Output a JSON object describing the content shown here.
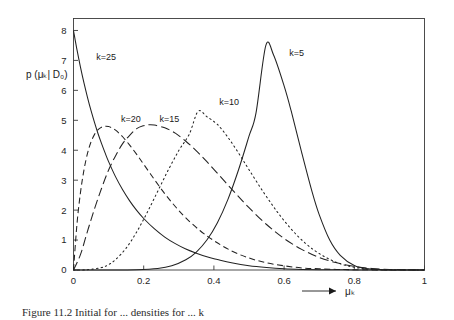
{
  "figure": {
    "caption": "Figure 11.2   Initial for ... densities for ... k"
  },
  "axes": {
    "ylabel": "p (μₖ| D₀)",
    "xlabel": "μₖ",
    "xlabel_arrow": "⟶",
    "x_ticks": [
      "0",
      "0.2",
      "0.4",
      "0.6",
      "0.8",
      "1"
    ],
    "x_tick_values": [
      0,
      0.2,
      0.4,
      0.6,
      0.8,
      1
    ],
    "y_ticks": [
      "0",
      "1",
      "2",
      "3",
      "4",
      "5",
      "6",
      "7",
      "8"
    ],
    "y_tick_values": [
      0,
      1,
      2,
      3,
      4,
      5,
      6,
      7,
      8
    ]
  },
  "chart_data": {
    "type": "line",
    "title": "",
    "xlabel": "μₖ",
    "ylabel": "p (μₖ| D₀)",
    "xlim": [
      0,
      1
    ],
    "ylim": [
      0,
      8.4
    ],
    "grid": false,
    "legend": "inline-annotations",
    "series": [
      {
        "name": "k=25",
        "label": "k=25",
        "style": "solid",
        "color": "#222222",
        "label_x": 0.065,
        "label_y": 7.0,
        "peak_x": 0.0,
        "peak_y": 8.0,
        "x": [
          0.0,
          0.01,
          0.02,
          0.03,
          0.04,
          0.05,
          0.06,
          0.07,
          0.08,
          0.09,
          0.1,
          0.12,
          0.14,
          0.16,
          0.18,
          0.2,
          0.23,
          0.26,
          0.29,
          0.32,
          0.35,
          0.38,
          0.41,
          0.45,
          0.5,
          0.55,
          0.6,
          0.65,
          0.7,
          0.75,
          0.8,
          0.85,
          0.9,
          0.95,
          1.0
        ],
        "y": [
          8.0,
          7.35,
          6.77,
          6.24,
          5.76,
          5.32,
          4.92,
          4.55,
          4.22,
          3.91,
          3.62,
          3.11,
          2.68,
          2.31,
          1.99,
          1.72,
          1.38,
          1.1,
          0.88,
          0.7,
          0.56,
          0.44,
          0.35,
          0.24,
          0.14,
          0.08,
          0.04,
          0.02,
          0.01,
          0.01,
          0.0,
          0.0,
          0.0,
          0.0,
          0.0
        ]
      },
      {
        "name": "k=20",
        "label": "k=20",
        "style": "dashed",
        "color": "#222222",
        "label_x": 0.135,
        "label_y": 4.95,
        "peak_x": 0.11,
        "peak_y": 4.8,
        "x": [
          0.0,
          0.01,
          0.02,
          0.03,
          0.04,
          0.05,
          0.06,
          0.07,
          0.08,
          0.09,
          0.1,
          0.11,
          0.12,
          0.14,
          0.16,
          0.18,
          0.2,
          0.23,
          0.26,
          0.29,
          0.32,
          0.36,
          0.4,
          0.45,
          0.5,
          0.55,
          0.6,
          0.65,
          0.7,
          0.75,
          0.8,
          0.9,
          1.0
        ],
        "y": [
          0.0,
          1.55,
          2.6,
          3.35,
          3.9,
          4.28,
          4.53,
          4.69,
          4.77,
          4.8,
          4.79,
          4.74,
          4.67,
          4.45,
          4.17,
          3.86,
          3.53,
          3.03,
          2.55,
          2.12,
          1.74,
          1.32,
          0.98,
          0.64,
          0.4,
          0.24,
          0.14,
          0.07,
          0.04,
          0.02,
          0.01,
          0.0,
          0.0
        ]
      },
      {
        "name": "k=15",
        "label": "k=15",
        "style": "longdash",
        "color": "#222222",
        "label_x": 0.245,
        "label_y": 4.95,
        "peak_x": 0.215,
        "peak_y": 4.85,
        "x": [
          0.0,
          0.02,
          0.04,
          0.06,
          0.08,
          0.1,
          0.12,
          0.14,
          0.16,
          0.18,
          0.2,
          0.215,
          0.23,
          0.26,
          0.29,
          0.32,
          0.35,
          0.38,
          0.42,
          0.46,
          0.5,
          0.55,
          0.6,
          0.65,
          0.7,
          0.75,
          0.8,
          0.85,
          0.9,
          1.0
        ],
        "y": [
          0.0,
          0.52,
          1.3,
          2.05,
          2.73,
          3.34,
          3.82,
          4.22,
          4.5,
          4.72,
          4.82,
          4.85,
          4.84,
          4.75,
          4.57,
          4.3,
          3.98,
          3.62,
          3.1,
          2.58,
          2.08,
          1.52,
          1.05,
          0.69,
          0.42,
          0.24,
          0.12,
          0.05,
          0.02,
          0.0
        ]
      },
      {
        "name": "k=10",
        "label": "k=10",
        "style": "dotted",
        "color": "#555555",
        "label_x": 0.415,
        "label_y": 5.5,
        "peak_x": 0.355,
        "peak_y": 5.3,
        "x": [
          0.0,
          0.04,
          0.08,
          0.1,
          0.12,
          0.15,
          0.18,
          0.21,
          0.24,
          0.27,
          0.3,
          0.33,
          0.355,
          0.38,
          0.41,
          0.44,
          0.47,
          0.5,
          0.54,
          0.58,
          0.62,
          0.66,
          0.7,
          0.75,
          0.8,
          0.85,
          0.9,
          1.0
        ],
        "y": [
          0.0,
          0.01,
          0.08,
          0.18,
          0.35,
          0.73,
          1.27,
          1.92,
          2.63,
          3.34,
          3.99,
          4.54,
          5.3,
          5.12,
          4.86,
          4.43,
          3.91,
          3.35,
          2.62,
          1.95,
          1.37,
          0.9,
          0.55,
          0.25,
          0.09,
          0.02,
          0.01,
          0.0
        ]
      },
      {
        "name": "k=5",
        "label": "k=5",
        "style": "solid",
        "color": "#222222",
        "label_x": 0.615,
        "label_y": 7.15,
        "peak_x": 0.548,
        "peak_y": 7.5,
        "x": [
          0.0,
          0.1,
          0.18,
          0.24,
          0.28,
          0.32,
          0.35,
          0.38,
          0.41,
          0.44,
          0.47,
          0.5,
          0.52,
          0.548,
          0.57,
          0.6,
          0.62,
          0.65,
          0.68,
          0.7,
          0.73,
          0.76,
          0.8,
          0.84,
          0.88,
          0.93,
          1.0
        ],
        "y": [
          0.0,
          0.0,
          0.01,
          0.05,
          0.14,
          0.34,
          0.6,
          1.0,
          1.58,
          2.36,
          3.34,
          4.47,
          5.25,
          7.5,
          7.18,
          6.15,
          5.32,
          3.93,
          2.6,
          1.85,
          1.0,
          0.49,
          0.15,
          0.04,
          0.01,
          0.0,
          0.0
        ]
      }
    ]
  }
}
